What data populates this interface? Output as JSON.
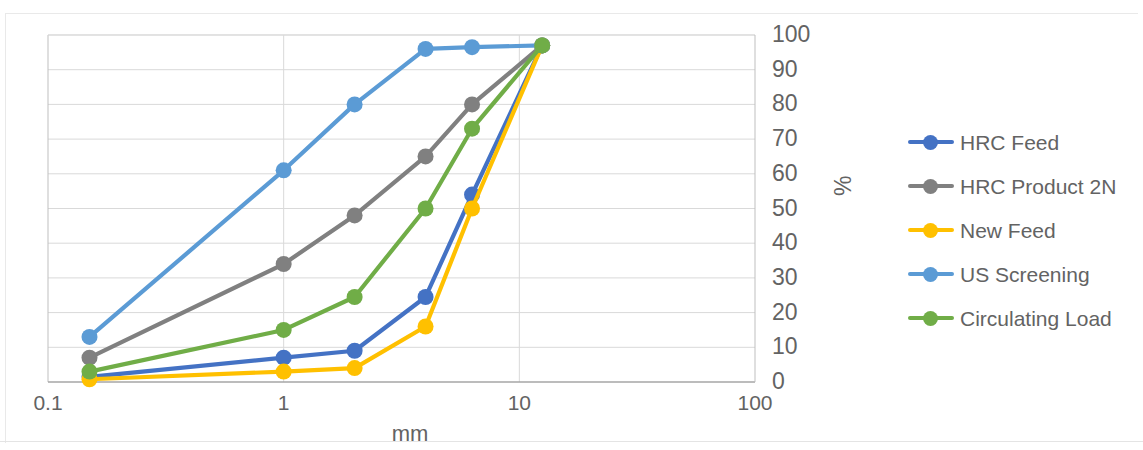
{
  "chart_data": {
    "type": "line",
    "title": "",
    "xlabel": "mm",
    "ylabel": "%",
    "xscale": "log",
    "xlim": [
      0.1,
      100
    ],
    "ylim": [
      0,
      100
    ],
    "grid": true,
    "legend_position": "right",
    "xticks": [
      "0.1",
      "1",
      "10",
      "100"
    ],
    "xtick_values": [
      0.1,
      1,
      10,
      100
    ],
    "yticks": [
      "0",
      "10",
      "20",
      "30",
      "40",
      "50",
      "60",
      "70",
      "80",
      "90",
      "100"
    ],
    "ytick_values": [
      0,
      10,
      20,
      30,
      40,
      50,
      60,
      70,
      80,
      90,
      100
    ],
    "y_axis_side": "right",
    "x": [
      0.15,
      1,
      2,
      4,
      6.3,
      12.5
    ],
    "series": [
      {
        "name": "HRC Feed",
        "color": "#4472C4",
        "values": [
          1.5,
          7,
          9,
          24.5,
          54,
          97
        ]
      },
      {
        "name": "HRC Product 2N",
        "color": "#808080",
        "values": [
          7,
          34,
          48,
          65,
          80,
          97
        ]
      },
      {
        "name": "New Feed",
        "color": "#FFC000",
        "values": [
          0.8,
          3,
          4,
          16,
          50,
          97
        ]
      },
      {
        "name": "US Screening",
        "color": "#5B9BD5",
        "values": [
          13,
          61,
          80,
          96,
          96.5,
          97
        ]
      },
      {
        "name": "Circulating Load",
        "color": "#70AD47",
        "values": [
          3,
          15,
          24.5,
          50,
          73,
          97
        ]
      }
    ]
  },
  "legend": {
    "items": [
      {
        "label": "HRC Feed"
      },
      {
        "label": "HRC Product 2N"
      },
      {
        "label": "New Feed"
      },
      {
        "label": "US Screening"
      },
      {
        "label": "Circulating Load"
      }
    ]
  },
  "axes": {
    "x_title": "mm",
    "y_title": "%"
  }
}
